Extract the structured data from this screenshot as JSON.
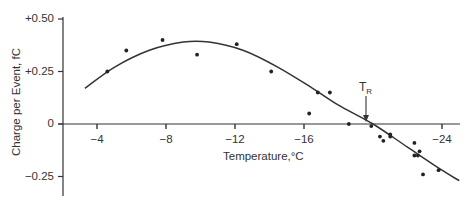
{
  "chart_data": {
    "type": "scatter",
    "title": "",
    "xlabel": "Temperature,°C",
    "ylabel": "Charge per Event, fC",
    "x_ticks": [
      "-4",
      "-8",
      "-12",
      "-16",
      "-24"
    ],
    "x_tick_values": [
      -4,
      -8,
      -12,
      -16,
      -24
    ],
    "y_ticks": [
      "+0.50",
      "+0.25",
      "0",
      "-0.25"
    ],
    "y_tick_values": [
      0.5,
      0.25,
      0,
      -0.25
    ],
    "xlim": [
      -2.8,
      -25.1
    ],
    "ylim": [
      -0.34,
      0.51
    ],
    "x_axis_reversed": true,
    "grid": false,
    "legend": null,
    "annotations": [
      {
        "text": "T_R",
        "label_main": "T",
        "label_sub": "R",
        "x": -20.0,
        "y": 0.0,
        "arrow": "down",
        "description": "Reversal temperature where charge crosses zero"
      }
    ],
    "series": [
      {
        "name": "measurements",
        "type": "scatter",
        "points": [
          {
            "x": -4.6,
            "y": 0.25
          },
          {
            "x": -5.7,
            "y": 0.35
          },
          {
            "x": -7.8,
            "y": 0.4
          },
          {
            "x": -9.8,
            "y": 0.33
          },
          {
            "x": -12.1,
            "y": 0.38
          },
          {
            "x": -14.1,
            "y": 0.25
          },
          {
            "x": -16.3,
            "y": 0.05
          },
          {
            "x": -16.8,
            "y": 0.15
          },
          {
            "x": -17.5,
            "y": 0.15
          },
          {
            "x": -18.6,
            "y": 0.0
          },
          {
            "x": -19.9,
            "y": -0.01
          },
          {
            "x": -20.4,
            "y": -0.06
          },
          {
            "x": -20.6,
            "y": -0.08
          },
          {
            "x": -21.0,
            "y": -0.05
          },
          {
            "x": -21.0,
            "y": -0.06
          },
          {
            "x": -22.4,
            "y": -0.09
          },
          {
            "x": -22.4,
            "y": -0.15
          },
          {
            "x": -22.6,
            "y": -0.15
          },
          {
            "x": -22.7,
            "y": -0.13
          },
          {
            "x": -22.9,
            "y": -0.24
          },
          {
            "x": -23.8,
            "y": -0.22
          }
        ]
      },
      {
        "name": "fit curve",
        "type": "line",
        "points": [
          {
            "x": -3.3,
            "y": 0.17
          },
          {
            "x": -5.0,
            "y": 0.27
          },
          {
            "x": -7.0,
            "y": 0.35
          },
          {
            "x": -9.0,
            "y": 0.39
          },
          {
            "x": -10.5,
            "y": 0.39
          },
          {
            "x": -12.5,
            "y": 0.35
          },
          {
            "x": -14.5,
            "y": 0.27
          },
          {
            "x": -16.5,
            "y": 0.17
          },
          {
            "x": -18.0,
            "y": 0.09
          },
          {
            "x": -20.0,
            "y": 0.0
          },
          {
            "x": -22.0,
            "y": -0.11
          },
          {
            "x": -24.0,
            "y": -0.22
          },
          {
            "x": -25.0,
            "y": -0.27
          }
        ]
      }
    ]
  },
  "layout_px": {
    "origin_x": 97,
    "x_per_degree": 17.25,
    "x_ref_value": -4,
    "zero_y": 124,
    "y_per_unit": 210
  }
}
